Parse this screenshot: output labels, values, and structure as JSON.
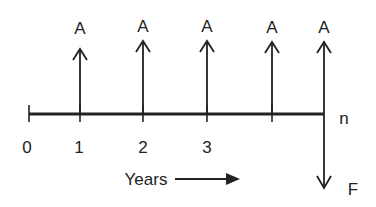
{
  "diagram": {
    "type": "cash-flow-diagram",
    "colors": {
      "line": "#222222",
      "background": "#ffffff"
    },
    "timeline": {
      "tick_labels": [
        "0",
        "1",
        "2",
        "3"
      ],
      "end_label": "n",
      "axis_label": "Years"
    },
    "payments": {
      "label": "A",
      "count": 5,
      "labels": [
        "A",
        "A",
        "A",
        "A",
        "A"
      ],
      "direction": "up"
    },
    "future_value": {
      "label": "F",
      "direction": "down"
    }
  }
}
